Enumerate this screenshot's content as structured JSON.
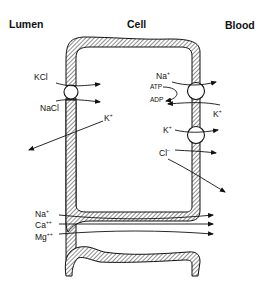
{
  "headers": {
    "lumen": "Lumen",
    "cell": "Cell",
    "blood": "Blood"
  },
  "luminal_membrane": {
    "cotransporter_substrates": [
      "KCl",
      "NaCl"
    ],
    "channel_ion": "K",
    "channel_ion_charge": "+"
  },
  "basolateral_membrane": {
    "pump": {
      "ion_out": "Na",
      "ion_out_charge": "+",
      "ion_in": "K",
      "ion_in_charge": "+",
      "energy_in": "ATP",
      "energy_out": "ADP"
    },
    "cotransporter": {
      "ions": [
        "K",
        "Cl"
      ],
      "charges": [
        "+",
        "−"
      ]
    }
  },
  "paracellular": {
    "ions": [
      {
        "name": "Na",
        "charge": "+"
      },
      {
        "name": "Ca",
        "charge": "++"
      },
      {
        "name": "Mg",
        "charge": "++"
      }
    ]
  }
}
